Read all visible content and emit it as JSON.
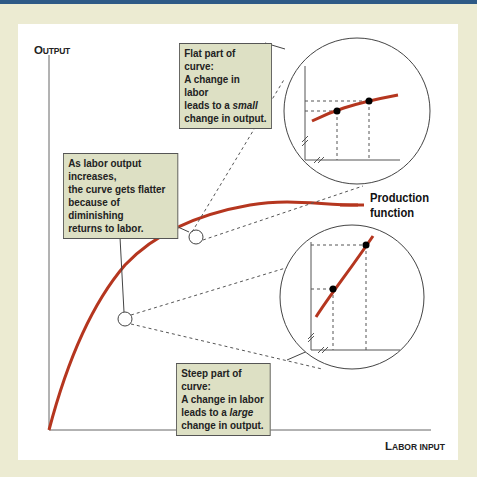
{
  "diagram": {
    "axes": {
      "y_label": {
        "first": "O",
        "rest": "UTPUT"
      },
      "x_label": {
        "first": "L",
        "rest": "ABOR INPUT"
      }
    },
    "curve_label": {
      "line1": "Production",
      "line2": "function"
    },
    "curve_color": "#b5361f",
    "callouts": {
      "flat": {
        "line1": "Flat part of curve:",
        "line2": "A change in labor",
        "line3_pre": "leads to a ",
        "line3_em": "small",
        "line4": "change in output."
      },
      "middle": {
        "line1": "As labor output increases,",
        "line2": "the curve gets flatter",
        "line3": "because of diminishing",
        "line4": "returns to labor."
      },
      "steep": {
        "line1": "Steep part of curve:",
        "line2": "A change in labor",
        "line3_pre": "leads to a ",
        "line3_em": "large",
        "line4": "change in output."
      }
    },
    "colors": {
      "background": "#ecebd2",
      "panel": "#ffffff",
      "callout_bg": "#dde0c4",
      "top_bar": "#2e5a86"
    }
  }
}
